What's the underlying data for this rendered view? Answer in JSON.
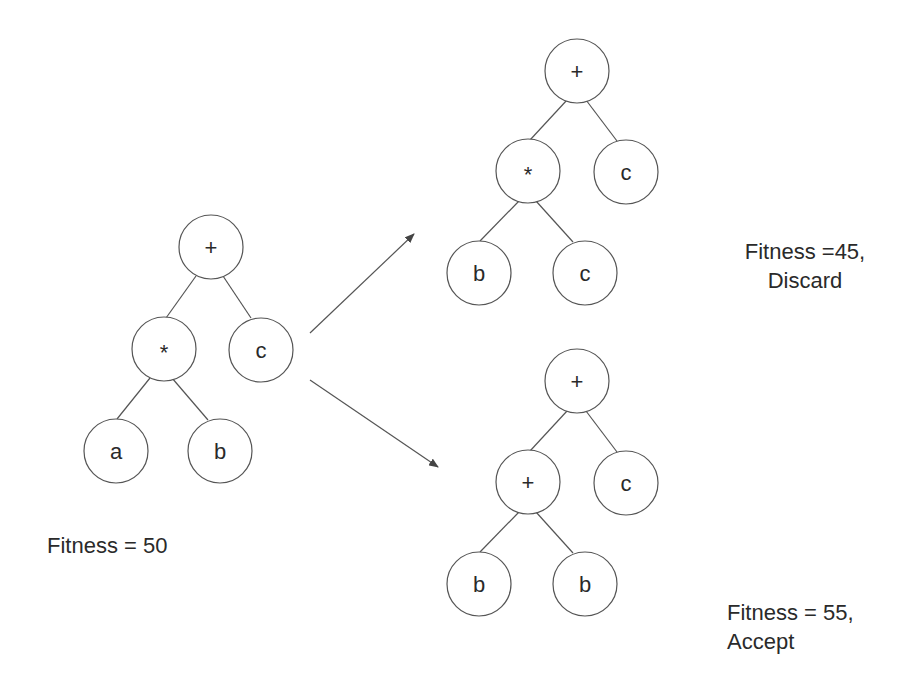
{
  "diagram": {
    "trees": [
      {
        "id": "parent",
        "fitness_label": "Fitness = 50",
        "nodes": [
          {
            "label": "+",
            "x": 211,
            "y": 247
          },
          {
            "label": "*",
            "x": 164,
            "y": 349
          },
          {
            "label": "c",
            "x": 261,
            "y": 350
          },
          {
            "label": "a",
            "x": 116,
            "y": 451
          },
          {
            "label": "b",
            "x": 220,
            "y": 451
          }
        ]
      },
      {
        "id": "offspring-discard",
        "fitness_label_line1": "Fitness =45,",
        "fitness_label_line2": "Discard",
        "nodes": [
          {
            "label": "+",
            "x": 577,
            "y": 71
          },
          {
            "label": "*",
            "x": 528,
            "y": 171
          },
          {
            "label": "c",
            "x": 626,
            "y": 172
          },
          {
            "label": "b",
            "x": 479,
            "y": 273
          },
          {
            "label": "c",
            "x": 585,
            "y": 273
          }
        ]
      },
      {
        "id": "offspring-accept",
        "fitness_label_line1": "Fitness = 55,",
        "fitness_label_line2": "Accept",
        "nodes": [
          {
            "label": "+",
            "x": 577,
            "y": 381
          },
          {
            "label": "+",
            "x": 528,
            "y": 482
          },
          {
            "label": "c",
            "x": 626,
            "y": 483
          },
          {
            "label": "b",
            "x": 479,
            "y": 584
          },
          {
            "label": "b",
            "x": 585,
            "y": 584
          }
        ]
      }
    ],
    "arrows": [
      {
        "from": "parent",
        "to": "offspring-discard"
      },
      {
        "from": "parent",
        "to": "offspring-accept"
      }
    ],
    "colors": {
      "stroke": "#555555",
      "text": "#2a2a2a",
      "background": "#ffffff"
    }
  }
}
